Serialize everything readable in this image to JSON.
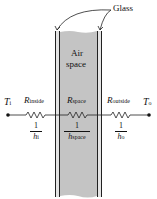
{
  "labels": {
    "glass": "Glass",
    "air_line1": "Air",
    "air_line2": "space",
    "t_inside": "T",
    "t_inside_sub": "i",
    "t_outside": "T",
    "t_outside_sub": "o"
  },
  "resistances": [
    {
      "name": "R",
      "sub": "inside",
      "frac_num": "1",
      "frac_den": "h",
      "frac_den_sub": "i"
    },
    {
      "name": "R",
      "sub": "space",
      "frac_num": "1",
      "frac_den": "h",
      "frac_den_sub": "space"
    },
    {
      "name": "R",
      "sub": "outside",
      "frac_num": "1",
      "frac_den": "h",
      "frac_den_sub": "o"
    }
  ],
  "colors": {
    "air_space": "#c4c4c4",
    "glass": "#e2e2e2",
    "line": "#222222"
  }
}
